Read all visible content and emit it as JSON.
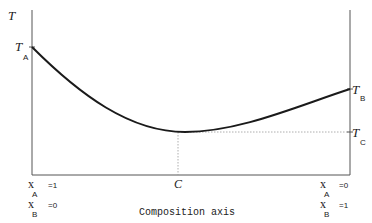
{
  "diagram": {
    "y_axis_label": "T",
    "x_axis_label": "Composition axis",
    "left_labels": {
      "T": "T",
      "T_sub": "A",
      "xA": "x",
      "xA_sub": "A",
      "xA_value": "=1",
      "xB": "x",
      "xB_sub": "B",
      "xB_value": "=0"
    },
    "right_labels": {
      "TB": "T",
      "TB_sub": "B",
      "TC": "T",
      "TC_sub": "C",
      "xA": "x",
      "xA_sub": "A",
      "xA_value": "=0",
      "xB": "x",
      "xB_sub": "B",
      "xB_value": "=1"
    },
    "minimum_label": "C",
    "curve": {
      "description": "Liquidus/critical temperature curve with a minimum at composition C",
      "T_at_left": "T_A",
      "T_at_right": "T_B",
      "T_at_minimum": "T_C",
      "color": "#1a1a1a"
    }
  }
}
